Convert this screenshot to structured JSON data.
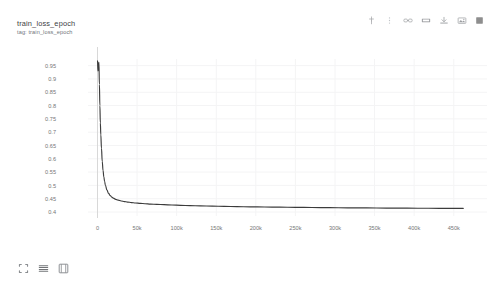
{
  "header": {
    "title": "train_loss_epoch",
    "subtitle": "tag: train_loss_epoch"
  },
  "toolbar": {
    "items": [
      {
        "name": "pin-icon",
        "label": "Pin card"
      },
      {
        "name": "dots-menu-icon",
        "label": "More options"
      },
      {
        "name": "link-icon",
        "label": "Copy link"
      },
      {
        "name": "fit-domain-icon",
        "label": "Fit domain to data"
      },
      {
        "name": "download-icon",
        "label": "Download data"
      },
      {
        "name": "image-export-icon",
        "label": "Export image"
      },
      {
        "name": "fullscreen-icon",
        "label": "Toggle fullscreen"
      }
    ]
  },
  "bottom_controls": {
    "items": [
      {
        "name": "expand-icon",
        "label": "Expand"
      },
      {
        "name": "list-view-icon",
        "label": "List view"
      },
      {
        "name": "fit-view-icon",
        "label": "Fit to view"
      }
    ]
  },
  "colors": {
    "line": "#3c3c3c",
    "grid": "#f4f4f5",
    "axis": "#d8d8d8",
    "tick_text": "#767676",
    "title_text": "#3c4043",
    "subtitle_text": "#70757a",
    "background": "#ffffff"
  },
  "chart_data": {
    "type": "line",
    "title": "train_loss_epoch",
    "subtitle": "tag: train_loss_epoch",
    "xlabel": "",
    "ylabel": "",
    "xlim": [
      -12000,
      492000
    ],
    "ylim": [
      0.385,
      0.975
    ],
    "grid": true,
    "legend": null,
    "x_ticks": [
      0,
      50000,
      100000,
      150000,
      200000,
      250000,
      300000,
      350000,
      400000,
      450000
    ],
    "x_tick_labels": [
      "0",
      "50k",
      "100k",
      "150k",
      "200k",
      "250k",
      "300k",
      "350k",
      "400k",
      "450k"
    ],
    "y_ticks": [
      0.4,
      0.45,
      0.5,
      0.55,
      0.6,
      0.65,
      0.7,
      0.75,
      0.8,
      0.85,
      0.9,
      0.95
    ],
    "y_tick_labels": [
      "0.4",
      "0.45",
      "0.5",
      "0.55",
      "0.6",
      "0.65",
      "0.7",
      "0.75",
      "0.8",
      "0.85",
      "0.9",
      "0.95"
    ],
    "series": [
      {
        "name": "train_loss_epoch",
        "color": "#3c3c3c",
        "x": [
          0,
          600,
          1200,
          1800,
          2400,
          3000,
          3600,
          4200,
          5000,
          6000,
          7000,
          8000,
          9000,
          10000,
          12000,
          14000,
          16000,
          18000,
          20000,
          23000,
          26000,
          30000,
          34000,
          38000,
          43000,
          48000,
          54000,
          60000,
          67000,
          75000,
          84000,
          94000,
          105000,
          117000,
          130000,
          145000,
          160000,
          176000,
          193000,
          211000,
          230000,
          250000,
          271000,
          293000,
          316000,
          340000,
          365000,
          391000,
          418000,
          446000,
          462000
        ],
        "y": [
          0.968,
          0.93,
          0.952,
          0.963,
          0.88,
          0.8,
          0.735,
          0.69,
          0.64,
          0.59,
          0.556,
          0.532,
          0.514,
          0.5,
          0.482,
          0.47,
          0.462,
          0.456,
          0.452,
          0.4475,
          0.4445,
          0.4415,
          0.4392,
          0.4374,
          0.4355,
          0.434,
          0.4324,
          0.4312,
          0.4299,
          0.4287,
          0.4275,
          0.4264,
          0.4252,
          0.4241,
          0.423,
          0.422,
          0.4211,
          0.4203,
          0.4195,
          0.4188,
          0.4181,
          0.4175,
          0.4169,
          0.4163,
          0.4158,
          0.4153,
          0.4148,
          0.4144,
          0.414,
          0.4136,
          0.4134
        ]
      }
    ]
  }
}
